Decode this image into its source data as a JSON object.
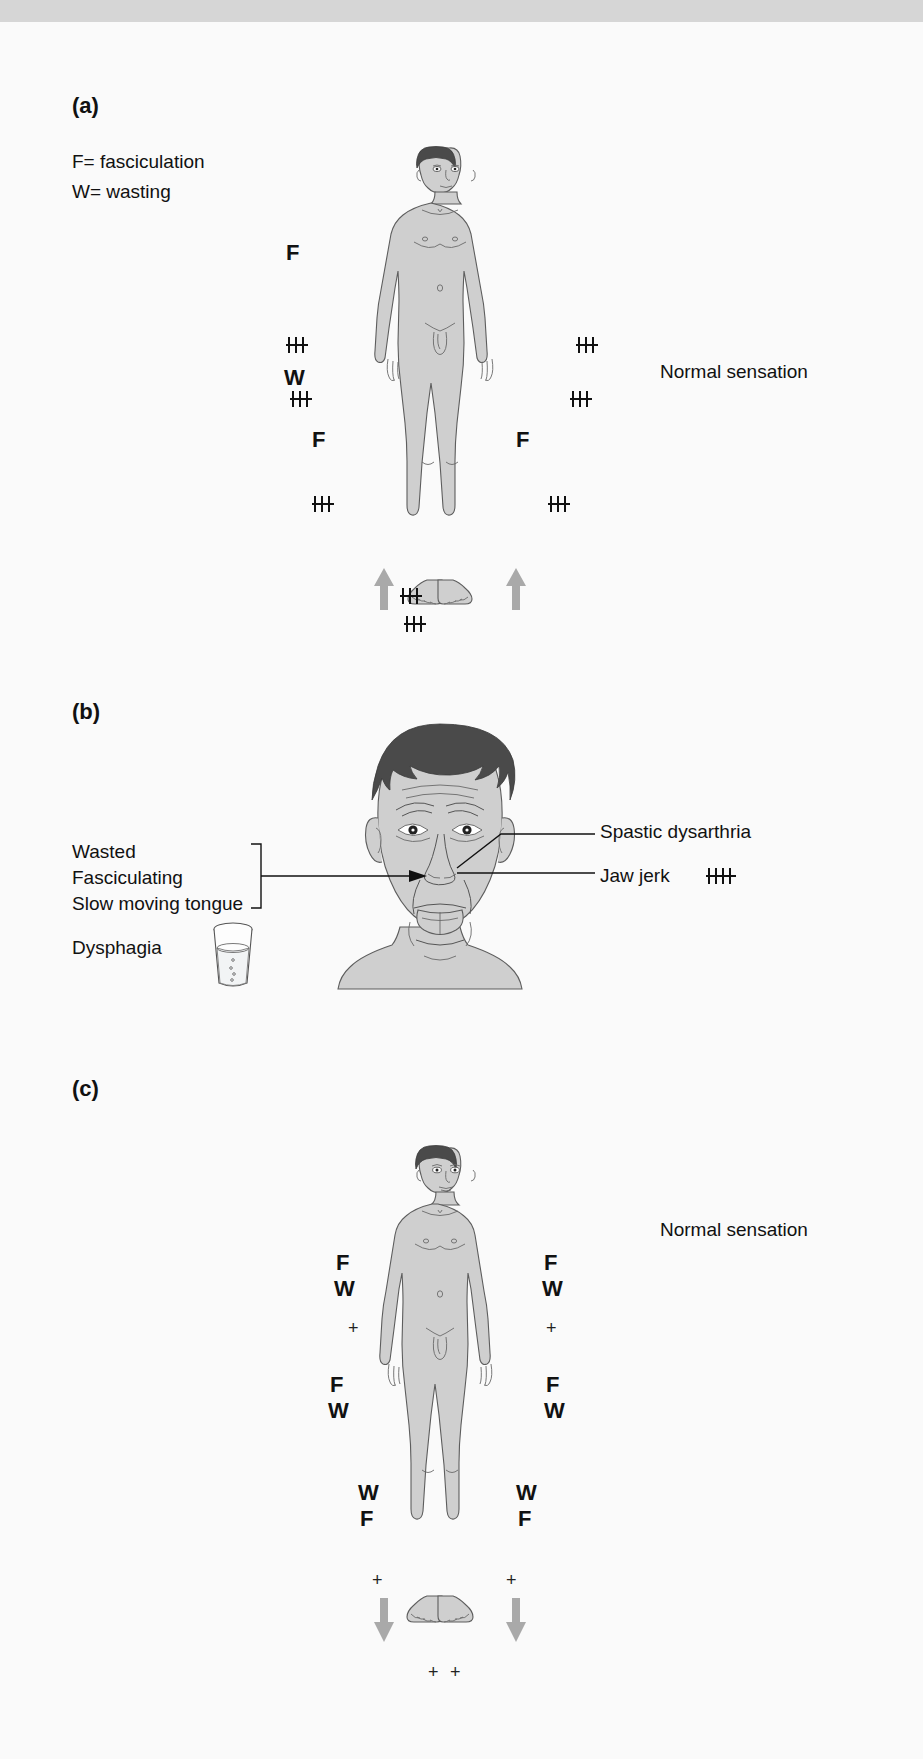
{
  "figure": {
    "panels": [
      {
        "id": "a",
        "label": "(a)",
        "legend": [
          "F= fasciculation",
          "W= wasting"
        ],
        "sensation_note": "Normal sensation",
        "muscle_marks": [
          {
            "side": "left",
            "text": "F",
            "region": "shoulder/upper arm"
          },
          {
            "side": "left",
            "text": "W",
            "region": "forearm"
          },
          {
            "side": "left",
            "text": "F",
            "region": "thigh"
          },
          {
            "side": "right",
            "text": "F",
            "region": "thigh"
          }
        ],
        "reflex_marks": [
          {
            "side": "left",
            "region": "biceps",
            "grade": "+++"
          },
          {
            "side": "right",
            "region": "biceps",
            "grade": "+++"
          },
          {
            "side": "left",
            "region": "supinator",
            "grade": "+++"
          },
          {
            "side": "right",
            "region": "supinator",
            "grade": "+++"
          },
          {
            "side": "left",
            "region": "knee",
            "grade": "+++"
          },
          {
            "side": "right",
            "region": "knee",
            "grade": "+++"
          },
          {
            "side": "left",
            "region": "ankle",
            "grade": "+++"
          },
          {
            "side": "right",
            "region": "ankle",
            "grade": "+++"
          }
        ],
        "plantar_response": {
          "direction": "up",
          "meaning": "extensor plantar response",
          "count": 2
        }
      },
      {
        "id": "b",
        "label": "(b)",
        "left_labels": [
          "Wasted",
          "Fasciculating",
          "Slow moving tongue"
        ],
        "left_labels_bracket": true,
        "dysphagia_label": "Dysphagia",
        "dysphagia_icon": "glass-of-water-icon",
        "right_labels": [
          {
            "text": "Spastic dysarthria",
            "grade": ""
          },
          {
            "text": "Jaw jerk",
            "grade": "++++"
          }
        ]
      },
      {
        "id": "c",
        "label": "(c)",
        "sensation_note": "Normal sensation",
        "muscle_marks": [
          {
            "side": "left",
            "text": "F",
            "region": "shoulder"
          },
          {
            "side": "left",
            "text": "W",
            "region": "upper arm"
          },
          {
            "side": "right",
            "text": "F",
            "region": "shoulder"
          },
          {
            "side": "right",
            "text": "W",
            "region": "upper arm"
          },
          {
            "side": "left",
            "text": "F",
            "region": "forearm"
          },
          {
            "side": "left",
            "text": "W",
            "region": "forearm"
          },
          {
            "side": "right",
            "text": "F",
            "region": "forearm"
          },
          {
            "side": "right",
            "text": "W",
            "region": "forearm"
          },
          {
            "side": "left",
            "text": "W",
            "region": "thigh"
          },
          {
            "side": "left",
            "text": "F",
            "region": "thigh"
          },
          {
            "side": "right",
            "text": "W",
            "region": "thigh"
          },
          {
            "side": "right",
            "text": "F",
            "region": "thigh"
          }
        ],
        "reflex_marks": [
          {
            "side": "left",
            "region": "biceps",
            "grade": "+"
          },
          {
            "side": "right",
            "region": "biceps",
            "grade": "+"
          },
          {
            "side": "left",
            "region": "knee",
            "grade": "+"
          },
          {
            "side": "right",
            "region": "knee",
            "grade": "+"
          },
          {
            "side": "left",
            "region": "ankle",
            "grade": "+"
          },
          {
            "side": "right",
            "region": "ankle",
            "grade": "+"
          }
        ],
        "plantar_response": {
          "direction": "down",
          "meaning": "flexor plantar response",
          "count": 2
        }
      }
    ]
  },
  "marks": {
    "a_F_left_shoulder": "F",
    "a_W_left_forearm": "W",
    "a_F_left_thigh": "F",
    "a_F_right_thigh": "F",
    "c_left_upper_F": "F",
    "c_left_upper_W": "W",
    "c_right_upper_F": "F",
    "c_right_upper_W": "W",
    "c_left_mid_F": "F",
    "c_left_mid_W": "W",
    "c_right_mid_F": "F",
    "c_right_mid_W": "W",
    "c_left_leg_W": "W",
    "c_left_leg_F": "F",
    "c_right_leg_W": "W",
    "c_right_leg_F": "F",
    "plus": "+"
  },
  "labels": {
    "panel_a": "(a)",
    "panel_b": "(b)",
    "panel_c": "(c)",
    "legend_f": "F= fasciculation",
    "legend_w": "W= wasting",
    "normal_sensation_a": "Normal sensation",
    "normal_sensation_c": "Normal sensation",
    "wasted": "Wasted",
    "fasciculating": "Fasciculating",
    "slow_moving_tongue": "Slow moving tongue",
    "dysphagia": "Dysphagia",
    "spastic_dysarthria": "Spastic dysarthria",
    "jaw_jerk": "Jaw jerk"
  },
  "colors": {
    "skin": "#cfcfcf",
    "outline": "#5d5d5d",
    "hair": "#4a4a4a",
    "arrow": "#a9a9a9",
    "text": "#111111",
    "band": "#d6d6d6"
  }
}
